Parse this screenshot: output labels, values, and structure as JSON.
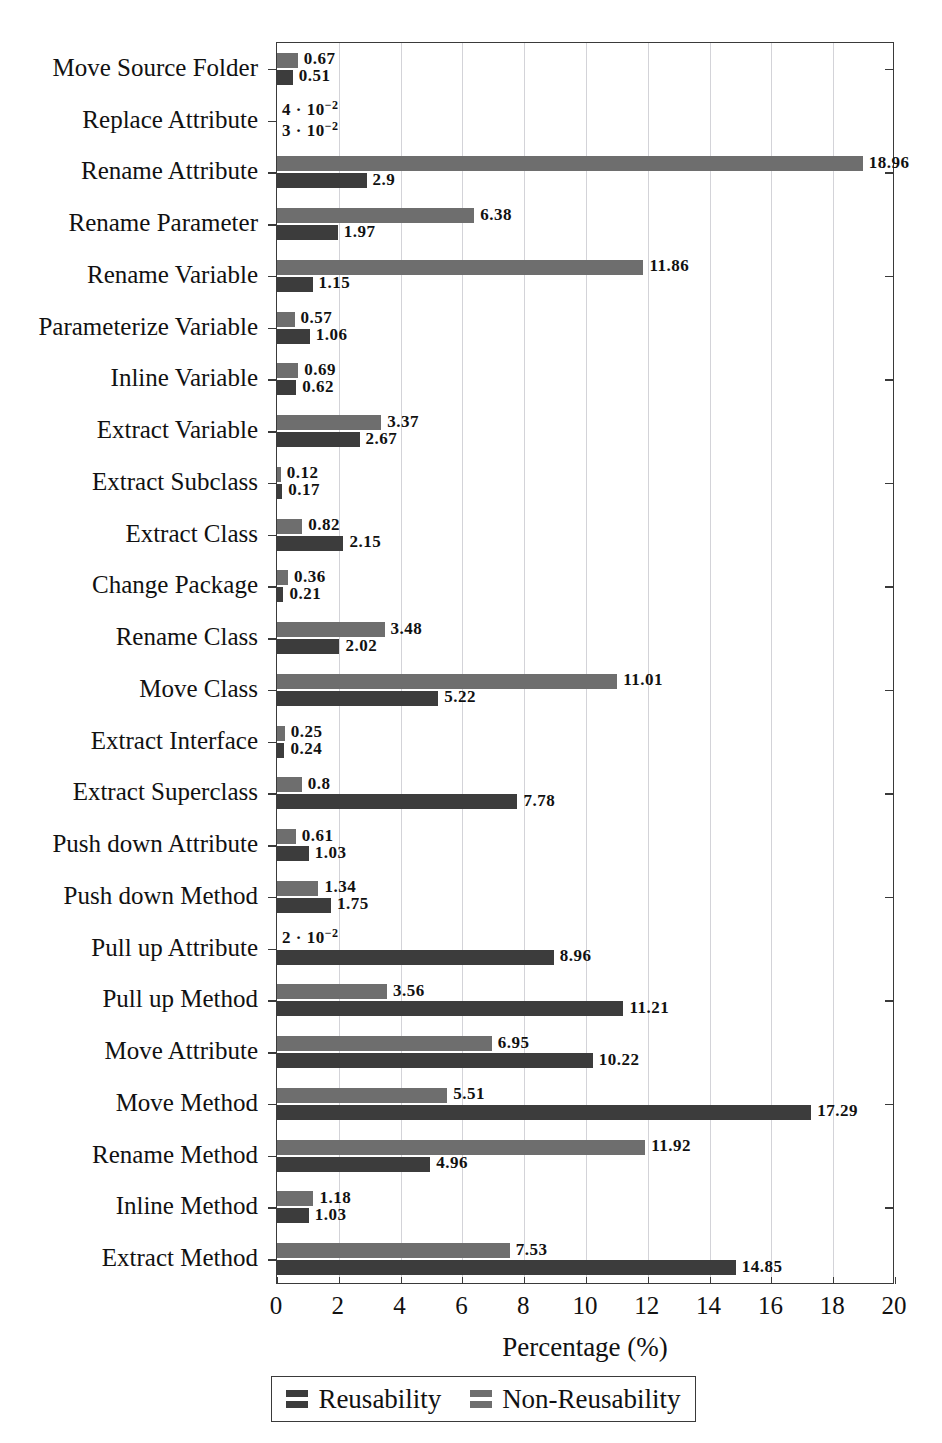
{
  "running_head": "",
  "chart_data": {
    "type": "bar",
    "orientation": "horizontal",
    "title": "",
    "xlabel": "Percentage (%)",
    "ylabel": "",
    "xlim": [
      0,
      20
    ],
    "xticks": [
      0,
      2,
      4,
      6,
      8,
      10,
      12,
      14,
      16,
      18,
      20
    ],
    "xtick_labels": [
      "0",
      "2",
      "4",
      "6",
      "8",
      "10",
      "12",
      "14",
      "16",
      "18",
      "20"
    ],
    "grid": "vertical",
    "legend_position": "below",
    "legend": [
      "Reusability",
      "Non-Reusability"
    ],
    "colors": {
      "reusability": "#3c3c3c",
      "non_reusability": "#6e6e6e"
    },
    "categories": [
      "Move Source Folder",
      "Replace Attribute",
      "Rename Attribute",
      "Rename Parameter",
      "Rename Variable",
      "Parameterize Variable",
      "Inline Variable",
      "Extract Variable",
      "Extract Subclass",
      "Extract Class",
      "Change Package",
      "Rename Class",
      "Move Class",
      "Extract Interface",
      "Extract Superclass",
      "Push down Attribute",
      "Push down Method",
      "Pull up Attribute",
      "Pull up Method",
      "Move Attribute",
      "Move Method",
      "Rename Method",
      "Inline Method",
      "Extract Method"
    ],
    "series": [
      {
        "name": "Non-Reusability",
        "color": "#6e6e6e",
        "values": [
          0.67,
          0.04,
          18.96,
          6.38,
          11.86,
          0.57,
          0.69,
          3.37,
          0.12,
          0.82,
          0.36,
          3.48,
          11.01,
          0.25,
          0.8,
          0.61,
          1.34,
          0.02,
          3.56,
          6.95,
          5.51,
          11.92,
          1.18,
          7.53
        ],
        "labels": [
          "0.67",
          "4 · 10⁻²",
          "18.96",
          "6.38",
          "11.86",
          "0.57",
          "0.69",
          "3.37",
          "0.12",
          "0.82",
          "0.36",
          "3.48",
          "11.01",
          "0.25",
          "0.8",
          "0.61",
          "1.34",
          "2 · 10⁻²",
          "3.56",
          "6.95",
          "5.51",
          "11.92",
          "1.18",
          "7.53"
        ]
      },
      {
        "name": "Reusability",
        "color": "#3c3c3c",
        "values": [
          0.51,
          0.03,
          2.9,
          1.97,
          1.15,
          1.06,
          0.62,
          2.67,
          0.17,
          2.15,
          0.21,
          2.02,
          5.22,
          0.24,
          7.78,
          1.03,
          1.75,
          8.96,
          11.21,
          10.22,
          17.29,
          4.96,
          1.03,
          14.85
        ],
        "labels": [
          "0.51",
          "3 · 10⁻²",
          "2.9",
          "1.97",
          "1.15",
          "1.06",
          "0.62",
          "2.67",
          "0.17",
          "2.15",
          "0.21",
          "2.02",
          "5.22",
          "0.24",
          "7.78",
          "1.03",
          "1.75",
          "8.96",
          "11.21",
          "10.22",
          "17.29",
          "4.96",
          "1.03",
          "14.85"
        ]
      }
    ]
  }
}
